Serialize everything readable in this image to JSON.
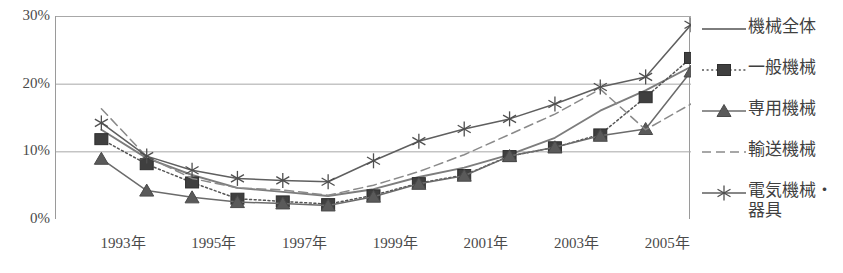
{
  "chart_data": {
    "type": "line",
    "title": "",
    "xlabel": "",
    "ylabel": "",
    "ylim": [
      0,
      30
    ],
    "yticks": [
      0,
      10,
      20,
      30
    ],
    "ytick_labels": [
      "0%",
      "10%",
      "20%",
      "30%"
    ],
    "grid": true,
    "legend_position": "right",
    "categories": [
      "1992年",
      "1993年",
      "1994年",
      "1995年",
      "1996年",
      "1997年",
      "1998年",
      "1999年",
      "2000年",
      "2001年",
      "2002年",
      "2003年",
      "2004年",
      "2005年",
      "2006年"
    ],
    "x": [
      1992,
      1993,
      1994,
      1995,
      1996,
      1997,
      1998,
      1999,
      2000,
      2001,
      2002,
      2003,
      2004,
      2005,
      2006
    ],
    "xtick_labels": [
      "1993年",
      "1995年",
      "1997年",
      "1999年",
      "2001年",
      "2003年",
      "2005年"
    ],
    "xtick_values": [
      1993,
      1995,
      1997,
      1999,
      2001,
      2003,
      2005
    ],
    "series": [
      {
        "name": "機械全体",
        "marker": "none",
        "dash": "solid",
        "color": "#7d7d7d",
        "values": [
          null,
          13.2,
          9.0,
          6.5,
          4.6,
          4.0,
          3.4,
          4.4,
          6.2,
          7.6,
          9.5,
          12.0,
          16.0,
          19.0,
          22.5
        ]
      },
      {
        "name": "一般機械",
        "marker": "square",
        "dash": "dotted",
        "color": "#555555",
        "values": [
          null,
          11.8,
          8.1,
          5.4,
          3.0,
          2.6,
          2.2,
          3.5,
          5.3,
          6.5,
          9.3,
          10.6,
          12.5,
          18.0,
          23.8
        ]
      },
      {
        "name": "専用機械",
        "marker": "triangle",
        "dash": "solid",
        "color": "#6b6b6b",
        "values": [
          null,
          8.9,
          4.2,
          3.2,
          2.5,
          2.3,
          2.0,
          3.3,
          5.2,
          6.4,
          9.3,
          10.6,
          12.3,
          13.3,
          21.8
        ]
      },
      {
        "name": "輸送機械",
        "marker": "none",
        "dash": "dashed",
        "color": "#8a8a8a",
        "values": [
          null,
          16.3,
          9.2,
          6.0,
          4.6,
          4.3,
          3.5,
          5.0,
          7.0,
          9.5,
          12.5,
          15.5,
          19.2,
          13.2,
          17.0
        ]
      },
      {
        "name": "電気機械・\n器具",
        "marker": "asterisk",
        "dash": "solid",
        "color": "#5f5f5f",
        "values": [
          null,
          14.2,
          9.3,
          7.2,
          6.0,
          5.7,
          5.5,
          8.6,
          11.5,
          13.3,
          14.8,
          17.0,
          19.5,
          21.0,
          28.7
        ]
      }
    ]
  },
  "legend": {
    "items": [
      {
        "label": "機械全体",
        "symbol": "line-solid-plain"
      },
      {
        "label": "一般機械",
        "symbol": "line-dotted-square"
      },
      {
        "label": "専用機械",
        "symbol": "line-solid-triangle"
      },
      {
        "label": "輸送機械",
        "symbol": "line-dashed-plain"
      },
      {
        "label": "電気機械・\n器具",
        "symbol": "line-solid-asterisk"
      }
    ]
  }
}
